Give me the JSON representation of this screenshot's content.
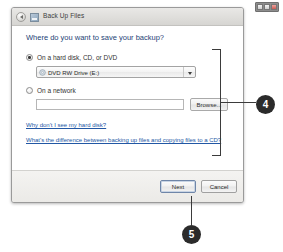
{
  "window": {
    "title": "Back Up Files",
    "back_button": "back-arrow",
    "controls": {
      "minimize": "minimize",
      "maximize": "maximize",
      "close": "close"
    }
  },
  "content": {
    "heading": "Where do you want to save your backup?",
    "options": [
      {
        "id": "hard-disk",
        "label": "On a hard disk, CD, or DVD",
        "selected": true
      },
      {
        "id": "network",
        "label": "On a network",
        "selected": false
      }
    ],
    "drive_combo": {
      "value": "DVD RW Drive (E:)",
      "icon": "optical-disc-icon",
      "arrow": "chevron-down-icon"
    },
    "network_path": {
      "value": "",
      "placeholder": ""
    },
    "browse_label": "Browse...",
    "links": [
      "Why don't I see my hard disk?",
      "What's the difference between backing up files and copying files to a CD?"
    ]
  },
  "footer": {
    "next_label": "Next",
    "cancel_label": "Cancel"
  },
  "callouts": [
    {
      "id": "4",
      "number": "4",
      "target": "content-region"
    },
    {
      "id": "5",
      "number": "5",
      "target": "next-button"
    }
  ],
  "colors": {
    "heading_blue": "#1d3f76",
    "link_blue": "#2257a4",
    "callout_bg": "#2b2b2b",
    "window_chrome": "#f2f1f0"
  }
}
